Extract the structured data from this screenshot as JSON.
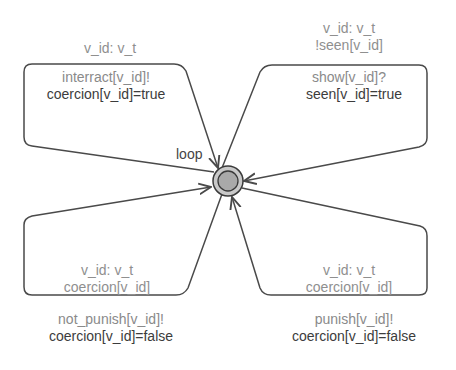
{
  "diagram": {
    "type": "timed-automaton",
    "location": {
      "name": "loop",
      "initial": true
    },
    "edges": [
      {
        "id": "top-left",
        "select": "v_id: v_t",
        "guard": "",
        "sync": "interract[v_id]!",
        "update": "coercion[v_id]=true"
      },
      {
        "id": "top-right",
        "select": "v_id: v_t",
        "guard": "!seen[v_id]",
        "sync": "show[v_id]?",
        "update": "seen[v_id]=true"
      },
      {
        "id": "bottom-left",
        "select": "v_id: v_t",
        "guard": "coercion[v_id]",
        "sync": "not_punish[v_id]!",
        "update": "coercion[v_id]=false"
      },
      {
        "id": "bottom-right",
        "select": "v_id: v_t",
        "guard": "coercion[v_id]",
        "sync": "punish[v_id]!",
        "update": "coercion[v_id]=false"
      }
    ],
    "colors": {
      "edge": "#4a4a4a",
      "node_fill": "#a9a9a9",
      "node_stroke": "#3a3a3a",
      "label_light": "#8f8f8f",
      "label_dark": "#3c3c3c"
    }
  }
}
